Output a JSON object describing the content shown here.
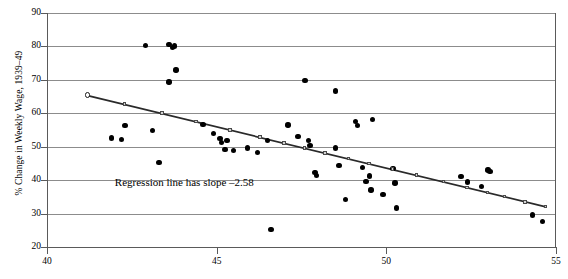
{
  "chart_data": {
    "type": "scatter",
    "title": "",
    "xlabel": "",
    "ylabel": "% Change in Weekly Wage, 1939–49",
    "xlim": [
      40,
      55
    ],
    "ylim": [
      20,
      90
    ],
    "xticks": [
      40,
      45,
      50,
      55
    ],
    "yticks": [
      20,
      30,
      40,
      50,
      60,
      70,
      80,
      90
    ],
    "grid": true,
    "legend": null,
    "annotations": [
      {
        "text": "Regression line has slope –2.58",
        "x": 42.0,
        "y": 39.0
      }
    ],
    "series": [
      {
        "name": "observations",
        "type": "scatter",
        "marker": "filled-circle",
        "color": "#000000",
        "points": [
          [
            41.9,
            52.6
          ],
          [
            42.2,
            52.1
          ],
          [
            42.3,
            56.3
          ],
          [
            42.9,
            80.3
          ],
          [
            43.1,
            54.9
          ],
          [
            43.3,
            45.2
          ],
          [
            43.6,
            80.6
          ],
          [
            43.7,
            79.6
          ],
          [
            43.75,
            80.1
          ],
          [
            43.8,
            72.9
          ],
          [
            43.6,
            69.4
          ],
          [
            44.6,
            56.6
          ],
          [
            44.9,
            53.9
          ],
          [
            45.1,
            52.4
          ],
          [
            45.15,
            51.3
          ],
          [
            45.3,
            51.8
          ],
          [
            45.25,
            49.1
          ],
          [
            45.5,
            48.9
          ],
          [
            45.9,
            49.6
          ],
          [
            46.2,
            48.2
          ],
          [
            46.5,
            51.8
          ],
          [
            46.6,
            25.3
          ],
          [
            47.1,
            56.5
          ],
          [
            47.4,
            53.1
          ],
          [
            47.6,
            69.9
          ],
          [
            47.7,
            51.9
          ],
          [
            47.75,
            50.4
          ],
          [
            47.9,
            42.3
          ],
          [
            47.95,
            41.4
          ],
          [
            48.5,
            66.7
          ],
          [
            48.5,
            49.6
          ],
          [
            48.6,
            44.3
          ],
          [
            48.8,
            34.3
          ],
          [
            49.1,
            57.6
          ],
          [
            49.15,
            56.4
          ],
          [
            49.3,
            43.7
          ],
          [
            49.4,
            39.6
          ],
          [
            49.5,
            41.2
          ],
          [
            49.55,
            37.0
          ],
          [
            49.6,
            58.2
          ],
          [
            49.9,
            35.7
          ],
          [
            50.2,
            43.4
          ],
          [
            50.25,
            39.2
          ],
          [
            50.3,
            31.7
          ],
          [
            52.2,
            41.1
          ],
          [
            52.4,
            39.5
          ],
          [
            52.8,
            38.1
          ],
          [
            53.0,
            43.0
          ],
          [
            53.05,
            42.5
          ],
          [
            54.3,
            29.6
          ],
          [
            54.6,
            27.6
          ]
        ]
      },
      {
        "name": "regression-line",
        "type": "line",
        "color": "#2a2a2a",
        "marker": "small-square",
        "slope": -2.58,
        "endpoints": [
          [
            41.2,
            65.3
          ],
          [
            54.7,
            32.0
          ]
        ],
        "marker_points": [
          [
            41.2,
            65.3
          ],
          [
            42.3,
            62.6
          ],
          [
            43.4,
            59.9
          ],
          [
            44.4,
            57.4
          ],
          [
            45.4,
            54.9
          ],
          [
            46.3,
            52.7
          ],
          [
            47.0,
            51.0
          ],
          [
            47.6,
            49.5
          ],
          [
            48.2,
            48.0
          ],
          [
            48.9,
            46.3
          ],
          [
            49.5,
            44.8
          ],
          [
            50.2,
            43.1
          ],
          [
            50.9,
            41.4
          ],
          [
            51.7,
            39.4
          ],
          [
            52.4,
            37.7
          ],
          [
            53.0,
            36.2
          ],
          [
            53.5,
            34.9
          ],
          [
            54.1,
            33.4
          ],
          [
            54.7,
            32.0
          ]
        ]
      }
    ]
  }
}
